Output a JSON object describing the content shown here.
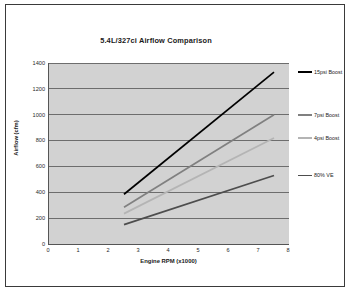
{
  "chart_data": {
    "type": "line",
    "title": "5.4L/327ci Airflow Comparison",
    "xlabel": "Engine RPM (x1000)",
    "ylabel": "Airflow (cfm)",
    "xlim": [
      0,
      8
    ],
    "ylim": [
      0,
      1400
    ],
    "xticks": [
      0,
      1,
      2,
      3,
      4,
      5,
      6,
      7,
      8
    ],
    "yticks": [
      0,
      200,
      400,
      600,
      800,
      1000,
      1200,
      1400
    ],
    "grid": "horizontal",
    "legend_position": "right",
    "plot_background": "#d2d2d2",
    "series": [
      {
        "name": "15psi Boost",
        "color": "#000000",
        "x": [
          2.5,
          7.5
        ],
        "values": [
          385,
          1330
        ]
      },
      {
        "name": "7psi Boost",
        "color": "#808080",
        "x": [
          2.5,
          7.5
        ],
        "values": [
          285,
          1000
        ]
      },
      {
        "name": "4psi Boost",
        "color": "#b4b4b4",
        "x": [
          2.5,
          7.5
        ],
        "values": [
          235,
          820
        ]
      },
      {
        "name": "80% VE",
        "color": "#4d4d4d",
        "x": [
          2.5,
          7.5
        ],
        "values": [
          150,
          530
        ]
      }
    ]
  },
  "frame": {
    "border_color": "#3a3a3a",
    "background": "#ffffff"
  }
}
